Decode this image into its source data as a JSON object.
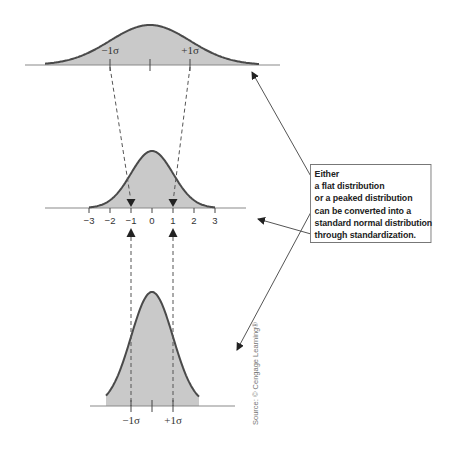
{
  "colors": {
    "fill": "#c9c9c9",
    "curve": "#4a4a4a",
    "axis": "#8a8a8a",
    "dashed": "#555555",
    "arrow": "#444444",
    "text": "#333333"
  },
  "distributions": [
    {
      "name": "flat-distribution",
      "center_x": 150,
      "axis_y": 65,
      "peak_y": 25,
      "sigma_px": 40,
      "curve_from": 45,
      "curve_to": 259,
      "axis_from": 25,
      "axis_to": 280,
      "labels": [
        {
          "text": "−1σ",
          "x": 110,
          "y": 54
        },
        {
          "text": "+1σ",
          "x": 190,
          "y": 54
        }
      ],
      "ticks": [
        110,
        150,
        190
      ]
    },
    {
      "name": "standard-normal-distribution",
      "center_x": 152,
      "axis_y": 208,
      "peak_y": 151,
      "sigma_px": 21,
      "curve_from": 89,
      "curve_to": 215,
      "axis_from": 45,
      "axis_to": 246,
      "tick_labels": [
        "−3",
        "−2",
        "−1",
        "0",
        "1",
        "2",
        "3"
      ],
      "ticks": [
        89,
        110,
        131,
        152,
        173,
        194,
        215
      ]
    },
    {
      "name": "peaked-distribution",
      "center_x": 152,
      "axis_y": 406,
      "peak_y": 292,
      "sigma_px": 21,
      "curve_from": 106,
      "curve_to": 199,
      "axis_from": 90,
      "axis_to": 235,
      "labels": [
        {
          "text": "−1σ",
          "x": 131,
          "y": 424
        },
        {
          "text": "+1σ",
          "x": 173,
          "y": 424
        }
      ],
      "ticks": [
        131,
        152,
        173
      ]
    }
  ],
  "callout": {
    "lines": [
      "Either",
      "a flat distribution",
      "or a peaked distribution",
      "can be converted into a",
      "standard normal distribution",
      "through standardization."
    ]
  },
  "source": "Source: © Cengage Learning®"
}
